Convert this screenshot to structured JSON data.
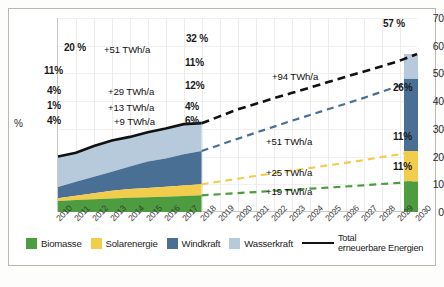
{
  "chart_data": {
    "type": "area",
    "title": "",
    "xlabel": "",
    "ylabel": "%",
    "ylim": [
      0,
      70
    ],
    "yticks": [
      0,
      10,
      20,
      30,
      40,
      50,
      60,
      70
    ],
    "grid": true,
    "legend_position": "bottom",
    "x": [
      2010,
      2011,
      2012,
      2013,
      2014,
      2015,
      2016,
      2017,
      2018,
      2019,
      2020,
      2021,
      2022,
      2023,
      2024,
      2025,
      2026,
      2027,
      2028,
      2029,
      2030
    ],
    "xticklabels": [
      "2010",
      "2011",
      "2012",
      "2013",
      "2014",
      "2015",
      "2016",
      "2017",
      "2018",
      "2019",
      "2020",
      "2021",
      "2022",
      "2023",
      "2024",
      "2025",
      "2026",
      "2027",
      "2028",
      "2029",
      "2030"
    ],
    "series": [
      {
        "name": "Biomasse",
        "color": "#4d9c3f",
        "style": "stacked-area-then-dashed-line",
        "values": [
          4,
          4.3,
          4.6,
          4.9,
          5.1,
          5.3,
          5.5,
          5.8,
          6,
          6.4,
          6.8,
          7.2,
          7.6,
          8,
          8.4,
          8.8,
          9.2,
          9.6,
          10.1,
          10.5,
          11
        ]
      },
      {
        "name": "Solarenergie",
        "color": "#f2cd4b",
        "style": "stacked-area-then-dashed-line",
        "values": [
          1,
          1.6,
          2.2,
          2.8,
          3.2,
          3.4,
          3.6,
          3.8,
          4,
          4.6,
          5.2,
          5.8,
          6.3,
          6.9,
          7.4,
          8,
          8.5,
          9.1,
          9.7,
          10.3,
          11
        ]
      },
      {
        "name": "Windkraft",
        "color": "#4a6f94",
        "style": "stacked-area-then-dashed-line",
        "values": [
          4,
          5,
          5.9,
          6.8,
          8.1,
          9.5,
          10.2,
          11.2,
          12,
          13.2,
          14.4,
          15.6,
          16.8,
          18,
          19.1,
          20.2,
          21.3,
          22.4,
          23.5,
          24.7,
          26
        ]
      },
      {
        "name": "Wasserkraft",
        "color": "#b7cadb",
        "style": "stacked-area",
        "values": [
          11,
          10.5,
          11.1,
          11.3,
          10.7,
          10.6,
          10.8,
          10.9,
          11,
          10.8,
          10.6,
          10.4,
          10.2,
          10,
          9.9,
          9.8,
          9.7,
          9.5,
          9.3,
          9.2,
          9
        ]
      },
      {
        "name": "Total erneuerbare Energien",
        "color": "#111111",
        "style": "line-solid-then-dashed",
        "values": [
          20,
          21.4,
          23.8,
          25.8,
          27.1,
          28.8,
          30.1,
          31.7,
          32,
          34.5,
          37,
          39,
          41,
          42.9,
          44.8,
          46.8,
          48.7,
          50.6,
          52.5,
          54.5,
          57
        ]
      }
    ],
    "point_labels": [
      {
        "year": 2010,
        "series": "Total erneuerbare Energien",
        "text": "20 %"
      },
      {
        "year": 2010,
        "series": "Wasserkraft",
        "text": "11%"
      },
      {
        "year": 2010,
        "series": "Windkraft",
        "text": "4%"
      },
      {
        "year": 2010,
        "series": "Solarenergie",
        "text": "1%"
      },
      {
        "year": 2010,
        "series": "Biomasse",
        "text": "4%"
      },
      {
        "year": 2018,
        "series": "Total erneuerbare Energien",
        "text": "32 %"
      },
      {
        "year": 2018,
        "series": "Wasserkraft",
        "text": "11%"
      },
      {
        "year": 2018,
        "series": "Windkraft",
        "text": "12%"
      },
      {
        "year": 2018,
        "series": "Solarenergie",
        "text": "4%"
      },
      {
        "year": 2018,
        "series": "Biomasse",
        "text": "6%"
      },
      {
        "year": 2030,
        "series": "Total erneuerbare Energien",
        "text": "57 %"
      },
      {
        "year": 2030,
        "series": "Windkraft",
        "text": "26%"
      },
      {
        "year": 2030,
        "series": "Solarenergie",
        "text": "11%"
      },
      {
        "year": 2030,
        "series": "Biomasse",
        "text": "11%"
      }
    ],
    "annotations": [
      {
        "text": "+51 TWh/a",
        "period": "2010-2018",
        "series": "Total erneuerbare Energien"
      },
      {
        "text": "+29 TWh/a",
        "period": "2010-2018",
        "series": "Windkraft"
      },
      {
        "text": "+13 TWh/a",
        "period": "2010-2018",
        "series": "Solarenergie"
      },
      {
        "text": "+9 TWh/a",
        "period": "2010-2018",
        "series": "Biomasse"
      },
      {
        "text": "+94 TWh/a",
        "period": "2018-2030",
        "series": "Total erneuerbare Energien"
      },
      {
        "text": "+51 TWh/a",
        "period": "2018-2030",
        "series": "Windkraft"
      },
      {
        "text": "+25 TWh/a",
        "period": "2018-2030",
        "series": "Solarenergie"
      },
      {
        "text": "+19 TWh/a",
        "period": "2018-2030",
        "series": "Biomasse"
      }
    ]
  },
  "axis": {
    "y_title": "%",
    "yticks": [
      "70",
      "60",
      "50",
      "40",
      "30",
      "20",
      "10",
      "0"
    ],
    "xticks": [
      "2010",
      "2011",
      "2012",
      "2013",
      "2014",
      "2015",
      "2016",
      "2017",
      "2018",
      "2019",
      "2020",
      "2021",
      "2022",
      "2023",
      "2024",
      "2025",
      "2026",
      "2027",
      "2028",
      "2029",
      "2030"
    ]
  },
  "labels_2010": {
    "total": "20 %",
    "wasserkraft": "11%",
    "windkraft": "4%",
    "solarenergie": "1%",
    "biomasse": "4%"
  },
  "labels_2018": {
    "total": "32 %",
    "wasserkraft": "11%",
    "windkraft": "12%",
    "solarenergie": "4%",
    "biomasse": "6%"
  },
  "labels_2030": {
    "total": "57 %",
    "windkraft": "26%",
    "solarenergie": "11%",
    "biomasse": "11%"
  },
  "annotations_past": {
    "total": "+51 TWh/a",
    "windkraft": "+29 TWh/a",
    "solarenergie": "+13 TWh/a",
    "biomasse": "+9 TWh/a"
  },
  "annotations_future": {
    "total": "+94 TWh/a",
    "windkraft": "+51 TWh/a",
    "solarenergie": "+25 TWh/a",
    "biomasse": "+19 TWh/a"
  },
  "legend": {
    "items": [
      {
        "label": "Biomasse",
        "color": "#4d9c3f"
      },
      {
        "label": "Solarenergie",
        "color": "#f2cd4b"
      },
      {
        "label": "Windkraft",
        "color": "#4a6f94"
      },
      {
        "label": "Wasserkraft",
        "color": "#b7cadb"
      }
    ],
    "total_line_label_1": "Total",
    "total_line_label_2": "erneuerbare Energien",
    "total_line_color": "#111111"
  }
}
